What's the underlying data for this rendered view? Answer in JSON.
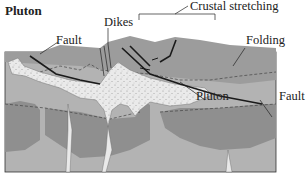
{
  "title": "Pluton",
  "labels": {
    "dikes": "Dikes",
    "crustal_stretching": "Crustal stretching",
    "fault_left": "Fault",
    "folding": "Folding",
    "pluton": "Pluton",
    "fault_right": "Fault"
  },
  "colors": {
    "upper_layer": "#9a9a9a",
    "mid_layer_light": "#b4b4b4",
    "mid_layer_dark": "#8e8e8e",
    "pluton": "#e9e9e9",
    "outline": "#1a1a1a"
  }
}
